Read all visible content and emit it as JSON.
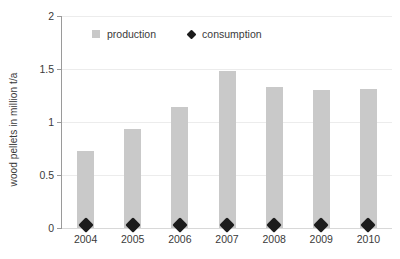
{
  "chart_data": {
    "type": "bar",
    "title": "",
    "subtitle": "",
    "xlabel": "",
    "ylabel": "wood pellets in million t/a",
    "ylim": [
      0,
      2
    ],
    "yticks": [
      0,
      0.5,
      1,
      1.5,
      2
    ],
    "ytick_labels": [
      "0",
      "0.5",
      "1",
      "1.5",
      "2"
    ],
    "grid": true,
    "legend_position": "top-center",
    "categories": [
      "2004",
      "2005",
      "2006",
      "2007",
      "2008",
      "2009",
      "2010"
    ],
    "series": [
      {
        "name": "production",
        "type": "bar",
        "color": "#c9c9c9",
        "values": [
          0.73,
          0.93,
          1.14,
          1.48,
          1.33,
          1.3,
          1.31
        ]
      },
      {
        "name": "consumption",
        "type": "scatter",
        "marker": "diamond",
        "color": "#1c1c1c",
        "values": [
          0.08,
          0.08,
          0.08,
          0.08,
          0.08,
          0.08,
          0.08
        ]
      }
    ]
  },
  "legend": {
    "items": [
      {
        "label": "production",
        "marker": "square-icon",
        "color": "#c9c9c9"
      },
      {
        "label": "consumption",
        "marker": "diamond-icon",
        "color": "#1c1c1c"
      }
    ]
  },
  "colors": {
    "bar": "#c9c9c9",
    "marker": "#1c1c1c",
    "gridline": "#ececec",
    "axis": "#9a9a9a",
    "text": "#3a3a3a",
    "background": "#ffffff"
  }
}
